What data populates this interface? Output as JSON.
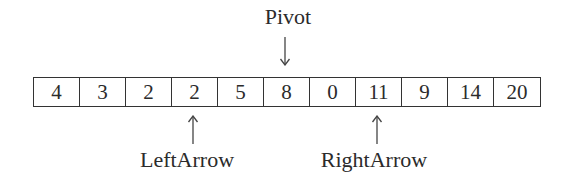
{
  "diagram": {
    "array": {
      "values": [
        "4",
        "3",
        "2",
        "2",
        "5",
        "8",
        "0",
        "11",
        "9",
        "14",
        "20"
      ]
    },
    "pointers": {
      "pivot": {
        "label": "Pivot",
        "index": 5,
        "direction": "down"
      },
      "left": {
        "label": "LeftArrow",
        "index": 3,
        "direction": "up"
      },
      "right": {
        "label": "RightArrow",
        "index": 7,
        "direction": "up"
      }
    },
    "icons": {
      "down_arrow": "↓",
      "up_arrow": "↑"
    },
    "colors": {
      "text": "#2b2b2b",
      "border": "#333333",
      "background": "#ffffff"
    }
  }
}
